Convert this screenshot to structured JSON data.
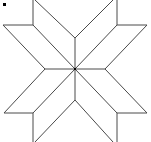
{
  "figure": {
    "type": "eight-point-star",
    "stroke_color": "#4a4a4a",
    "center_dot_color": "#000000",
    "background": "#ffffff",
    "center": [
      75,
      69
    ],
    "marker": {
      "x": 3,
      "y": 3
    }
  },
  "segments": [
    [
      35,
      0,
      75,
      38
    ],
    [
      113,
      0,
      75,
      38
    ],
    [
      75,
      38,
      75,
      69
    ],
    [
      35,
      0,
      33,
      0
    ],
    [
      33,
      0,
      33,
      25
    ],
    [
      33,
      25,
      3,
      25
    ],
    [
      3,
      25,
      45,
      69
    ],
    [
      33,
      25,
      75,
      69
    ],
    [
      113,
      0,
      117,
      0
    ],
    [
      117,
      0,
      117,
      25
    ],
    [
      117,
      25,
      147,
      25
    ],
    [
      147,
      25,
      105,
      69
    ],
    [
      117,
      25,
      75,
      69
    ],
    [
      45,
      69,
      75,
      69
    ],
    [
      75,
      69,
      105,
      69
    ],
    [
      45,
      69,
      4,
      113
    ],
    [
      4,
      113,
      33,
      113
    ],
    [
      33,
      113,
      75,
      69
    ],
    [
      33,
      113,
      33,
      142
    ],
    [
      105,
      69,
      147,
      113
    ],
    [
      147,
      113,
      117,
      113
    ],
    [
      117,
      113,
      75,
      69
    ],
    [
      117,
      113,
      117,
      142
    ],
    [
      75,
      69,
      75,
      100
    ],
    [
      75,
      100,
      35,
      142
    ],
    [
      75,
      100,
      113,
      142
    ],
    [
      33,
      142,
      75,
      100
    ],
    [
      117,
      142,
      75,
      100
    ]
  ]
}
